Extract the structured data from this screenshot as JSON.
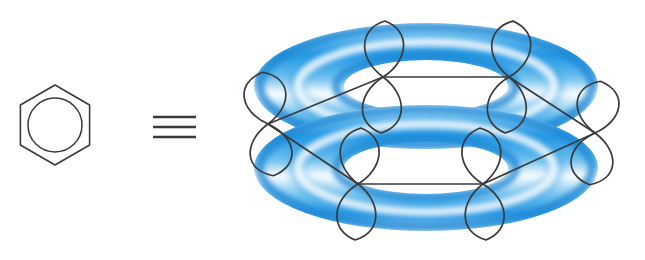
{
  "figure": {
    "background_color": "#ffffff",
    "ink_color": "#3a3a3a",
    "accent_blue": "#2196e3",
    "accent_blue_deep": "#1b86d4",
    "accent_blue_light": "#7fc8f0",
    "highlight_white": "#ffffff"
  },
  "left_symbol": {
    "name": "benzene-ring-skeletal-symbol",
    "description": "Hexagon with inscribed circle denoting aromatic benzene",
    "hexagon": {
      "center_x": 55,
      "center_y": 125,
      "radius": 40,
      "vertices": [
        {
          "x": 55,
          "y": 85
        },
        {
          "x": 89.6,
          "y": 105
        },
        {
          "x": 89.6,
          "y": 145
        },
        {
          "x": 55,
          "y": 165
        },
        {
          "x": 20.4,
          "y": 145
        },
        {
          "x": 20.4,
          "y": 105
        }
      ],
      "stroke_width": 1.6
    },
    "inner_circle": {
      "center_x": 55,
      "center_y": 125,
      "radius": 27,
      "stroke_width": 1.5
    }
  },
  "equivalence_sign": {
    "name": "identical-to-sign",
    "glyph": "≡",
    "bars": [
      {
        "x1": 153,
        "y1": 117,
        "x2": 196,
        "y2": 117
      },
      {
        "x1": 153,
        "y1": 127,
        "x2": 196,
        "y2": 127
      },
      {
        "x1": 153,
        "y1": 137,
        "x2": 196,
        "y2": 137
      }
    ],
    "stroke_width": 2.4
  },
  "torus_model": {
    "name": "benzene-pi-cloud-double-torus",
    "description": "Two stacked blue toroidal pi-electron clouds above and below the ring plane",
    "center_x": 426,
    "upper_torus": {
      "center_y": 86,
      "outer_rx": 172,
      "outer_ry": 63,
      "inner_rx": 82,
      "inner_ry": 26,
      "band_highlight_offset": 0.52
    },
    "lower_torus": {
      "center_y": 168,
      "outer_rx": 172,
      "outer_ry": 63,
      "inner_rx": 82,
      "inner_ry": 26,
      "band_highlight_offset": 0.52
    }
  },
  "ring_skeleton": {
    "name": "carbon-hexagon-ring-perspective",
    "description": "Hexagonal carbon framework drawn in perspective through the torus gap",
    "vertices": [
      {
        "id": "C1",
        "label": "left",
        "x": 268,
        "y": 124
      },
      {
        "id": "C2",
        "label": "back-left",
        "x": 383,
        "y": 77
      },
      {
        "id": "C3",
        "label": "back-right",
        "x": 509,
        "y": 77
      },
      {
        "id": "C4",
        "label": "right",
        "x": 595,
        "y": 133
      },
      {
        "id": "C5",
        "label": "front-right",
        "x": 483,
        "y": 184
      },
      {
        "id": "C6",
        "label": "front-left",
        "x": 358,
        "y": 184
      }
    ],
    "bonds": [
      {
        "from": "C1",
        "to": "C2"
      },
      {
        "from": "C2",
        "to": "C3"
      },
      {
        "from": "C3",
        "to": "C4"
      },
      {
        "from": "C4",
        "to": "C5"
      },
      {
        "from": "C5",
        "to": "C6"
      },
      {
        "from": "C6",
        "to": "C1"
      }
    ],
    "stroke_width": 1.7
  },
  "p_orbitals": {
    "name": "p-orbital-lobes",
    "count": 6,
    "description": "Vertical figure-eight p orbitals, one per carbon, perpendicular to the ring plane",
    "stroke_width": 1.7,
    "lobes": [
      {
        "id": "p1",
        "at": "C1",
        "cx": 268,
        "cy": 124,
        "lobe_w": 29,
        "lobe_h": 52,
        "tilt": -6
      },
      {
        "id": "p2",
        "at": "C2",
        "cx": 383,
        "cy": 77,
        "lobe_w": 27,
        "lobe_h": 56,
        "tilt": 2
      },
      {
        "id": "p3",
        "at": "C3",
        "cx": 509,
        "cy": 77,
        "lobe_w": 27,
        "lobe_h": 56,
        "tilt": 4
      },
      {
        "id": "p4",
        "at": "C4",
        "cx": 595,
        "cy": 133,
        "lobe_w": 29,
        "lobe_h": 52,
        "tilt": 6
      },
      {
        "id": "p5",
        "at": "C5",
        "cx": 483,
        "cy": 184,
        "lobe_w": 27,
        "lobe_h": 56,
        "tilt": -3
      },
      {
        "id": "p6",
        "at": "C6",
        "cx": 358,
        "cy": 184,
        "lobe_w": 27,
        "lobe_h": 56,
        "tilt": 3
      }
    ]
  }
}
